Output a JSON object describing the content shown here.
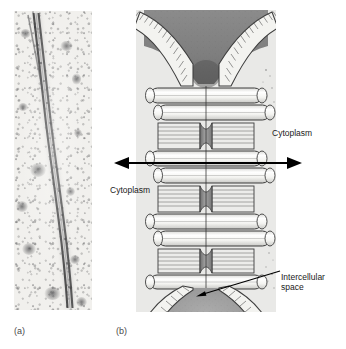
{
  "figure": {
    "background_color": "#ffffff",
    "width": 346,
    "height": 349
  },
  "panels": [
    {
      "caption": "(a)",
      "name": "electron-micrograph",
      "kind": "electron micrograph",
      "description": "Thin-section transmission electron micrograph showing two closely apposed plasma membranes forming a dark parallel double line (the gap junction) running vertically through a pale granular cytoplasm.",
      "background_color": "#f2f1ee",
      "membrane_color": "#4a4a4c"
    },
    {
      "caption": "(b)",
      "name": "schematic-diagram",
      "kind": "schematic drawing",
      "description": "Cut-away drawing of a gap junction plaque: two parallel plasma membranes drawn as stacked lipid-bilayer cylinders, joined by hourglass-shaped connexon channels, flaring apart at top and bottom to enclose the intercellular space.",
      "background_color": "#e9e9e7",
      "membrane_fill": "#f7f7f5",
      "membrane_stroke": "#3d3d3d",
      "connexon_fill": "#8f8f8f",
      "space_fill": "#9a9a9a"
    }
  ],
  "labels": {
    "cytoplasm_right": "Cytoplasm",
    "cytoplasm_left": "Cytoplasm",
    "intercellular_space_line1": "Intercellular",
    "intercellular_space_line2": "space",
    "text_color": "#1a1a1a"
  },
  "captions": {
    "panel_a": "(a)",
    "panel_b": "(b)",
    "color": "#4a4a4a"
  },
  "annotations": {
    "double_arrow": {
      "name": "cytoplasm-span-double-arrow",
      "direction": "both",
      "color": "#000000",
      "meaning": "arrow spanning from the cytoplasm of one cell, across the junction, to the cytoplasm of the adjacent cell"
    },
    "leader_line": {
      "name": "intercellular-space-leader",
      "color": "#000000",
      "meaning": "pointer from the Intercellular space label to the gray space between the two membranes"
    }
  }
}
